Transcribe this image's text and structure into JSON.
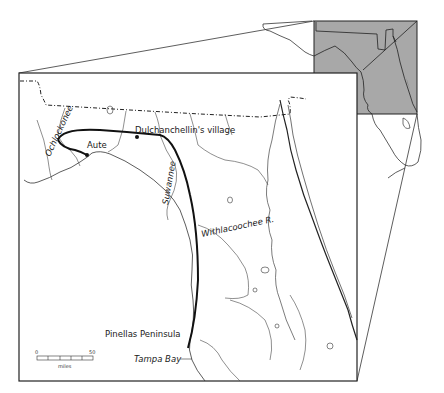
{
  "map": {
    "labels": {
      "ochlockonee": "Ochlockonee",
      "aute": "Aute",
      "dulchanchellin": "Dulchanchellin's village",
      "suwannee": "Suwannee",
      "withlacoochee": "Withlacoochee R.",
      "pinellas": "Pinellas Peninsula",
      "tampa_bay": "Tampa Bay"
    },
    "scale_bar": {
      "min_label": "0",
      "max_label": "50",
      "unit": "miles",
      "segments": 5
    },
    "colors": {
      "route": "#111111",
      "inset_fill": "#a8a8a8",
      "outline": "#222222",
      "background": "#ffffff"
    },
    "inset": {
      "description": "Florida locator map with highlighted north Florida region"
    }
  }
}
